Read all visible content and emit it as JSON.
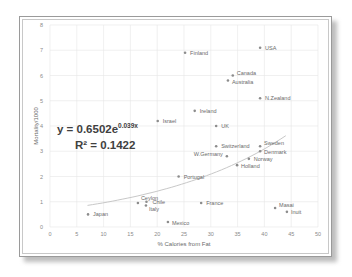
{
  "chart_data": {
    "type": "scatter",
    "title": "",
    "xlabel": "% Calories from Fat",
    "ylabel": "Mortality/1000",
    "xlim": [
      0,
      50
    ],
    "ylim": [
      0,
      8
    ],
    "x_ticks": [
      0,
      5,
      10,
      15,
      20,
      25,
      30,
      35,
      40,
      45,
      50
    ],
    "y_ticks": [
      0,
      1,
      2,
      3,
      4,
      5,
      6,
      7,
      8
    ],
    "grid": true,
    "legend": "none",
    "series": [
      {
        "name": "Countries",
        "points": [
          {
            "label": "Finland",
            "x": 25.2,
            "y": 6.9
          },
          {
            "label": "USA",
            "x": 39.2,
            "y": 7.1
          },
          {
            "label": "Canada",
            "x": 34.1,
            "y": 6.0
          },
          {
            "label": "Australia",
            "x": 33.2,
            "y": 5.8
          },
          {
            "label": "N.Zealand",
            "x": 39.2,
            "y": 5.1
          },
          {
            "label": "Ireland",
            "x": 27.0,
            "y": 4.6
          },
          {
            "label": "Israel",
            "x": 20.1,
            "y": 4.2
          },
          {
            "label": "UK",
            "x": 31.0,
            "y": 4.0
          },
          {
            "label": "Switzerland",
            "x": 31.0,
            "y": 3.2
          },
          {
            "label": "Sweden",
            "x": 39.2,
            "y": 3.2
          },
          {
            "label": "Denmark",
            "x": 39.2,
            "y": 3.0
          },
          {
            "label": "W.Germany",
            "x": 33.0,
            "y": 2.8
          },
          {
            "label": "Norway",
            "x": 37.1,
            "y": 2.7
          },
          {
            "label": "Holland",
            "x": 34.9,
            "y": 2.45
          },
          {
            "label": "Portugal",
            "x": 24.0,
            "y": 2.0
          },
          {
            "label": "Ceylon",
            "x": 16.4,
            "y": 0.95
          },
          {
            "label": "Chile",
            "x": 18.0,
            "y": 1.0
          },
          {
            "label": "Italy",
            "x": 17.9,
            "y": 0.85
          },
          {
            "label": "France",
            "x": 28.2,
            "y": 0.95
          },
          {
            "label": "Mexico",
            "x": 22.0,
            "y": 0.2
          },
          {
            "label": "Japan",
            "x": 7.1,
            "y": 0.5
          },
          {
            "label": "Masai",
            "x": 42.0,
            "y": 0.75
          },
          {
            "label": "Inuit",
            "x": 44.2,
            "y": 0.6
          }
        ]
      }
    ],
    "trendline": {
      "type": "exponential",
      "a": 0.6502,
      "b": 0.039,
      "x_range": [
        7,
        44
      ],
      "equation_text": "y = 0.6502e",
      "equation_exponent": "0.039x",
      "r2_text": "R² = 0.1422"
    },
    "colors": {
      "marker": "#8c8c8c",
      "trendline": "#c8c8c8",
      "grid": "#e6e6e6"
    }
  }
}
